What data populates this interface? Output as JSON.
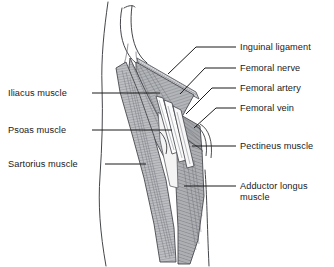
{
  "figure": {
    "background_color": "#ffffff",
    "ink_color": "#1a1a1a",
    "muscle_fill_color": "#a8aaae",
    "muscle_fill_light": "#c9cbcf",
    "vessel_fill_color": "#fdfdfd",
    "outline_color": "#44464a"
  },
  "labels": {
    "left": [
      {
        "id": "iliacus",
        "text": "Iliacus muscle",
        "text_x": 8,
        "text_y": 96,
        "line_x1": 92,
        "line_y1": 93,
        "line_x2": 160,
        "line_y2": 93
      },
      {
        "id": "psoas",
        "text": "Psoas muscle",
        "text_x": 8,
        "text_y": 133,
        "line_x1": 92,
        "line_y1": 130,
        "line_x2": 172,
        "line_y2": 130
      },
      {
        "id": "sartorius",
        "text": "Sartorius muscle",
        "text_x": 8,
        "text_y": 167,
        "line_x1": 105,
        "line_y1": 164,
        "line_x2": 146,
        "line_y2": 164
      }
    ],
    "right": [
      {
        "id": "inguinal-ligament",
        "text": "Inguinal ligament",
        "text_x": 240,
        "text_y": 50,
        "path": "M 236,47 L 196,47 L 168,74"
      },
      {
        "id": "femoral-nerve",
        "text": "Femoral nerve",
        "text_x": 240,
        "text_y": 71,
        "path": "M 236,68 L 205,68 L 180,94"
      },
      {
        "id": "femoral-artery",
        "text": "Femoral artery",
        "text_x": 240,
        "text_y": 91,
        "path": "M 236,88 L 212,88 L 186,114"
      },
      {
        "id": "femoral-vein",
        "text": "Femoral vein",
        "text_x": 240,
        "text_y": 111,
        "path": "M 236,108 L 216,108 L 194,128"
      },
      {
        "id": "pectineus",
        "text": "Pectineus muscle",
        "text_x": 240,
        "text_y": 149,
        "path": "M 236,146 L 192,146"
      },
      {
        "id": "adductor-longus-line1",
        "text": "Adductor longus",
        "text_x": 240,
        "text_y": 189,
        "path": "M 236,186 L 184,186"
      },
      {
        "id": "adductor-longus-line2",
        "text": "muscle",
        "text_x": 240,
        "text_y": 200,
        "path": ""
      }
    ]
  },
  "anatomy": {
    "body_contour_label": "torso-and-thigh-outline",
    "structures": [
      {
        "name": "iliacus-muscle"
      },
      {
        "name": "psoas-muscle"
      },
      {
        "name": "sartorius-muscle"
      },
      {
        "name": "pectineus-muscle"
      },
      {
        "name": "adductor-longus-muscle"
      },
      {
        "name": "inguinal-ligament"
      },
      {
        "name": "femoral-nerve"
      },
      {
        "name": "femoral-artery"
      },
      {
        "name": "femoral-vein"
      }
    ]
  }
}
